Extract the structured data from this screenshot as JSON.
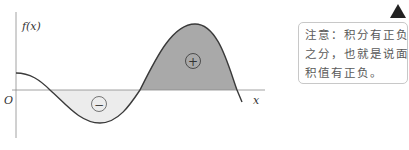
{
  "diagram": {
    "y_axis_label": "f(x)",
    "x_axis_label": "x",
    "origin_label": "O",
    "negative_region_symbol": "−",
    "positive_region_symbol": "+",
    "colors": {
      "curve": "#3a3a3a",
      "axis": "#8a8a8a",
      "positive_fill": "#a9a9a9",
      "negative_fill": "#ececec",
      "text": "#333333"
    }
  },
  "note": {
    "lines": [
      "注意：积分有正负",
      "之分，也就是说面",
      "积值有正负。"
    ]
  },
  "icons": {
    "warning": "warning-triangle-icon"
  }
}
